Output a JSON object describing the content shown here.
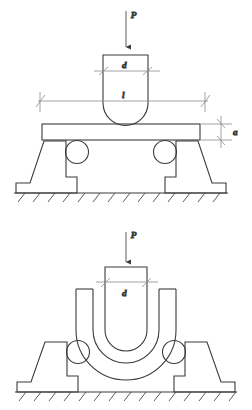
{
  "figure": {
    "stroke_color": "#3b3b3b",
    "dim_color": "#777777",
    "background": "#ffffff"
  },
  "stages": [
    {
      "name": "before-bending",
      "labels": {
        "force": "P",
        "punch_width": "d",
        "span": "l",
        "plate_thickness": "a"
      },
      "parts": [
        "force-arrow",
        "punch",
        "sheet-blank",
        "left-roller",
        "right-roller",
        "left-support",
        "right-support",
        "ground"
      ]
    },
    {
      "name": "after-bending",
      "labels": {
        "force": "P",
        "punch_width": "d"
      },
      "parts": [
        "force-arrow",
        "punch",
        "bent-sheet",
        "left-roller",
        "right-roller",
        "left-support",
        "right-support",
        "ground"
      ]
    }
  ]
}
